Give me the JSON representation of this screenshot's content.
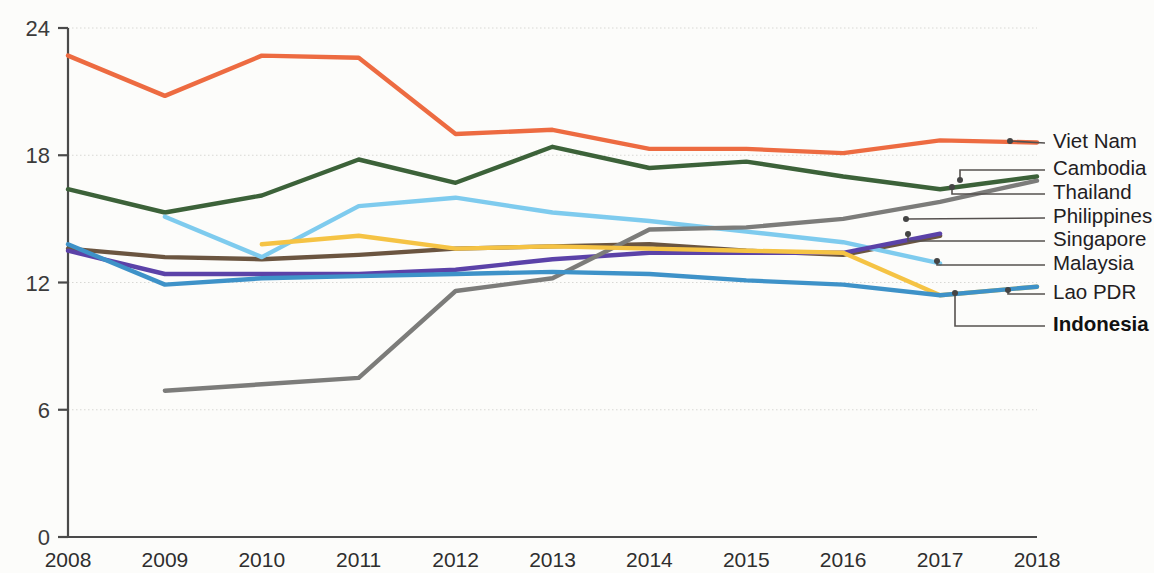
{
  "chart_data": {
    "type": "line",
    "title": "",
    "subtitle": "",
    "xlabel": "",
    "ylabel": "",
    "x": [
      2008,
      2009,
      2010,
      2011,
      2012,
      2013,
      2014,
      2015,
      2016,
      2017,
      2018
    ],
    "categories": [
      "2008",
      "2009",
      "2010",
      "2011",
      "2012",
      "2013",
      "2014",
      "2015",
      "2016",
      "2017",
      "2018"
    ],
    "xlim": [
      2008,
      2018
    ],
    "ylim": [
      0,
      24
    ],
    "yticks": [
      0,
      6,
      12,
      18,
      24
    ],
    "ytick_labels": [
      "0",
      "6",
      "12",
      "18",
      "24"
    ],
    "grid": true,
    "grid_axis": "y",
    "legend_position": "right-outside-labels",
    "series": [
      {
        "name": "Viet Nam",
        "color": "#ED6B41",
        "bold": false,
        "x": [
          2008,
          2009,
          2010,
          2011,
          2012,
          2013,
          2014,
          2015,
          2016,
          2017,
          2018
        ],
        "values": [
          22.7,
          20.8,
          22.7,
          22.6,
          19.0,
          19.2,
          18.3,
          18.3,
          18.1,
          18.7,
          18.6
        ]
      },
      {
        "name": "Cambodia",
        "color": "#3C6239",
        "bold": false,
        "x": [
          2008,
          2009,
          2010,
          2011,
          2012,
          2013,
          2014,
          2015,
          2016,
          2017,
          2018
        ],
        "values": [
          16.4,
          15.3,
          16.1,
          17.8,
          16.7,
          18.4,
          17.4,
          17.7,
          17.0,
          16.4,
          17.0
        ]
      },
      {
        "name": "Thailand",
        "color": "#6B5540",
        "bold": false,
        "x": [
          2008,
          2009,
          2010,
          2011,
          2012,
          2013,
          2014,
          2015,
          2016,
          2017,
          2018
        ],
        "values": [
          13.6,
          13.2,
          13.1,
          13.3,
          13.6,
          13.7,
          13.8,
          13.5,
          13.3,
          14.2,
          null
        ]
      },
      {
        "name": "Philippines",
        "color": "#7ECBEE",
        "bold": false,
        "x": [
          2009,
          2010,
          2011,
          2012,
          2013,
          2014,
          2015,
          2016,
          2017
        ],
        "values": [
          15.1,
          13.2,
          15.6,
          16.0,
          15.3,
          14.9,
          14.4,
          13.9,
          12.9
        ]
      },
      {
        "name": "Singapore",
        "color": "#5B42A8",
        "bold": false,
        "x": [
          2008,
          2009,
          2010,
          2011,
          2012,
          2013,
          2014,
          2015,
          2016,
          2017
        ],
        "values": [
          13.5,
          12.4,
          12.4,
          12.4,
          12.6,
          13.1,
          13.4,
          13.4,
          13.4,
          14.3
        ]
      },
      {
        "name": "Malaysia",
        "color": "#7C7C7A",
        "bold": false,
        "x": [
          2009,
          2010,
          2011,
          2012,
          2013,
          2014,
          2015,
          2016,
          2017,
          2018
        ],
        "values": [
          6.9,
          7.2,
          7.5,
          11.6,
          12.2,
          14.5,
          14.6,
          15.0,
          15.8,
          16.8
        ]
      },
      {
        "name": "Lao PDR",
        "color": "#F5C344",
        "bold": false,
        "x": [
          2010,
          2011,
          2012,
          2013,
          2014,
          2015,
          2016,
          2017,
          2018
        ],
        "values": [
          13.8,
          14.2,
          13.6,
          13.7,
          13.6,
          13.5,
          13.4,
          11.4,
          11.8
        ]
      },
      {
        "name": "Indonesia",
        "color": "#3E92C8",
        "bold": true,
        "x": [
          2008,
          2009,
          2010,
          2011,
          2012,
          2013,
          2014,
          2015,
          2016,
          2017,
          2018
        ],
        "values": [
          13.8,
          11.9,
          12.2,
          12.3,
          12.4,
          12.5,
          12.4,
          12.1,
          11.9,
          11.4,
          11.8
        ]
      }
    ],
    "legend_entries": [
      {
        "label": "Viet Nam",
        "bold": false
      },
      {
        "label": "Cambodia",
        "bold": false
      },
      {
        "label": "Thailand",
        "bold": false
      },
      {
        "label": "Philippines",
        "bold": false
      },
      {
        "label": "Singapore",
        "bold": false
      },
      {
        "label": "Malaysia",
        "bold": false
      },
      {
        "label": "Lao PDR",
        "bold": false
      },
      {
        "label": "Indonesia",
        "bold": true
      }
    ],
    "legend_label_y": [
      143,
      170,
      194,
      218,
      241,
      265,
      294,
      326
    ],
    "legend_anchor_points": [
      {
        "name": "Viet Nam",
        "px": 1010,
        "py": 141
      },
      {
        "name": "Cambodia",
        "px": 960,
        "py": 180
      },
      {
        "name": "Thailand",
        "px": 952,
        "py": 187
      },
      {
        "name": "Philippines",
        "px": 906,
        "py": 219
      },
      {
        "name": "Singapore",
        "px": 908,
        "py": 234
      },
      {
        "name": "Malaysia",
        "px": 937,
        "py": 261
      },
      {
        "name": "Lao PDR",
        "px": 1008,
        "py": 290
      },
      {
        "name": "Indonesia",
        "px": 955,
        "py": 293
      }
    ]
  },
  "axes": {
    "y_axis_name": "value-axis",
    "x_axis_name": "year-axis"
  }
}
